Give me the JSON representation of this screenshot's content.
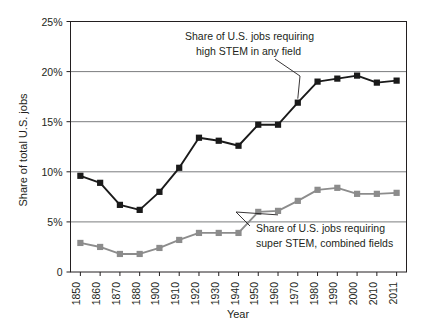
{
  "chart_data": {
    "type": "line",
    "title": "",
    "xlabel": "Year",
    "ylabel": "Share of total U.S. jobs",
    "ylim": [
      0,
      25
    ],
    "yticks": [
      0,
      5,
      10,
      15,
      20,
      25
    ],
    "ytick_labels": [
      "0",
      "5%",
      "10%",
      "15%",
      "20%",
      "25%"
    ],
    "grid": "horizontal",
    "legend": "none",
    "categories": [
      "1850",
      "1860",
      "1870",
      "1880",
      "1900",
      "1910",
      "1920",
      "1930",
      "1940",
      "1950",
      "1960",
      "1970",
      "1980",
      "1990",
      "2000",
      "2010",
      "2011"
    ],
    "series": [
      {
        "name": "Share of U.S. jobs requiring high STEM in any field",
        "color": "#1a1a1a",
        "marker": "square",
        "values": [
          9.6,
          8.9,
          6.7,
          6.2,
          8.0,
          10.4,
          13.4,
          13.1,
          12.6,
          14.7,
          14.7,
          16.9,
          19.0,
          19.3,
          19.6,
          18.9,
          19.1
        ]
      },
      {
        "name": "Share of U.S. jobs requiring super STEM, combined fields",
        "color": "#8c8c8c",
        "marker": "square",
        "values": [
          2.9,
          2.5,
          1.8,
          1.8,
          2.4,
          3.2,
          3.9,
          3.9,
          3.9,
          6.0,
          6.1,
          7.1,
          8.2,
          8.4,
          7.8,
          7.8,
          7.9
        ]
      }
    ],
    "annotations": [
      {
        "id": "annotation-high-stem",
        "line1": "Share of U.S. jobs requiring",
        "line2": "high STEM in any field",
        "points_to_category": "1970"
      },
      {
        "id": "annotation-super-stem",
        "line1": "Share of U.S. jobs requiring",
        "line2": "super STEM, combined fields",
        "points_to_category": "1960"
      }
    ]
  }
}
